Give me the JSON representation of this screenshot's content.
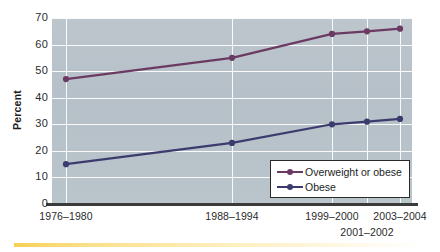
{
  "chart_data": {
    "type": "line",
    "title": "",
    "subtitle": "",
    "xlabel": "",
    "ylabel": "Percent",
    "ylim": [
      0,
      70
    ],
    "ytick_step": 10,
    "grid": true,
    "legend_position": "bottom-right",
    "categories": [
      "1976–1980",
      "1988–1994",
      "1999–2000",
      "2001–2002",
      "2003–2004"
    ],
    "yticks": [
      "0",
      "10",
      "20",
      "30",
      "40",
      "50",
      "60",
      "70"
    ],
    "series": [
      {
        "name": "Overweight or obese",
        "color": "#6b3a63",
        "values": [
          47,
          55,
          64,
          65,
          66
        ]
      },
      {
        "name": "Obese",
        "color": "#3b3b6e",
        "values": [
          15,
          23,
          30,
          31,
          32
        ]
      }
    ]
  },
  "axis": {
    "y_title": "Percent",
    "y_ticks": [
      {
        "label": "70",
        "value": 70
      },
      {
        "label": "60",
        "value": 60
      },
      {
        "label": "50",
        "value": 50
      },
      {
        "label": "40",
        "value": 40
      },
      {
        "label": "30",
        "value": 30
      },
      {
        "label": "20",
        "value": 20
      },
      {
        "label": "10",
        "value": 10
      },
      {
        "label": "0",
        "value": 0
      }
    ],
    "x_ticks": [
      {
        "label": "1976–1980",
        "x": 66,
        "row": 0
      },
      {
        "label": "1988–1994",
        "x": 232,
        "row": 0
      },
      {
        "label": "1999–2000",
        "x": 332,
        "row": 0
      },
      {
        "label": "2003–2004",
        "x": 400,
        "row": 0
      },
      {
        "label": "2001–2002",
        "x": 367,
        "row": 1
      }
    ]
  },
  "legend": {
    "items": [
      {
        "label": "Overweight or obese",
        "color": "#6b3a63"
      },
      {
        "label": "Obese",
        "color": "#3b3b6e"
      }
    ]
  },
  "colors": {
    "plot_background": "#b8c2ca",
    "gridline": "#ffffff",
    "axis_line": "#3b3b3b",
    "overweight_series": "#6b3a63",
    "obese_series": "#3b3b6e",
    "accent_band": "#f7d154"
  }
}
